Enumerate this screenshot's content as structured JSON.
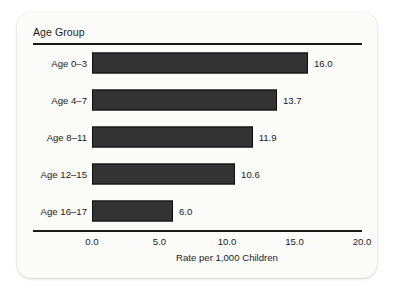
{
  "chart_data": {
    "type": "bar",
    "orientation": "horizontal",
    "title": "",
    "category_axis_title": "Age Group",
    "categories": [
      "Age 0–3",
      "Age 4–7",
      "Age 8–11",
      "Age 12–15",
      "Age 16–17"
    ],
    "values": [
      16.0,
      13.7,
      11.9,
      10.6,
      6.0
    ],
    "value_labels": [
      "16.0",
      "13.7",
      "11.9",
      "10.6",
      "6.0"
    ],
    "xlabel": "Rate per 1,000 Children",
    "ylabel": "Age Group",
    "xlim": [
      0.0,
      20.0
    ],
    "xticks": [
      0.0,
      5.0,
      10.0,
      15.0,
      20.0
    ],
    "xtick_labels": [
      "0.0",
      "5.0",
      "10.0",
      "15.0",
      "20.0"
    ],
    "grid": false,
    "legend": null,
    "bar_color": "#333333",
    "bar_edge_color": "#0d0d0d",
    "background_color": "#fbfbfa",
    "text_color": "#1c1c1c"
  }
}
